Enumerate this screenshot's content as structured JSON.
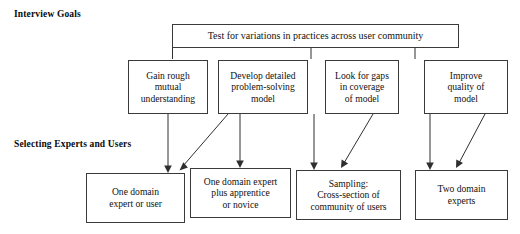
{
  "diagram": {
    "row_labels": {
      "interview_goals": "Interview Goals",
      "selecting_experts": "Selecting Experts and Users"
    },
    "top_box": {
      "label": "Test for variations in practices across user community"
    },
    "goal_boxes": [
      {
        "label": "Gain rough\nmutual\nunderstanding"
      },
      {
        "label": "Develop detailed\nproblem-solving\nmodel"
      },
      {
        "label": "Look for gaps\nin coverage\nof model"
      },
      {
        "label": "Improve\nquality of\nmodel"
      }
    ],
    "selection_boxes": [
      {
        "label": "One domain\nexpert or user"
      },
      {
        "label": "One domain expert\nplus apprentice\nor novice"
      },
      {
        "label": "Sampling:\nCross-section of\ncommunity of users"
      },
      {
        "label": "Two domain\nexperts"
      }
    ],
    "colors": {
      "box_border": "#3a3a3a",
      "connector": "#2f2f2f",
      "text": "#111111",
      "background": "#ffffff"
    }
  }
}
